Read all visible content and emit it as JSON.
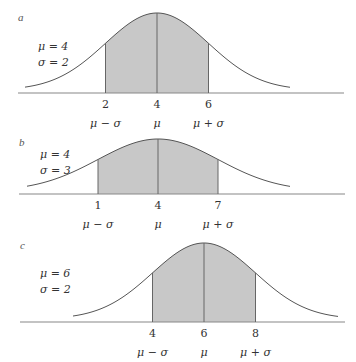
{
  "chart_data": [
    {
      "type": "area",
      "panel_label": "a",
      "params": {
        "mu": 4,
        "sigma": 2
      },
      "param_labels": [
        "μ = 4",
        "σ = 2"
      ],
      "shaded_region": [
        2,
        6
      ],
      "ticks": [
        {
          "value": 2,
          "label": "2",
          "symbol": "μ − σ"
        },
        {
          "value": 4,
          "label": "4",
          "symbol": "μ"
        },
        {
          "value": 6,
          "label": "6",
          "symbol": "μ + σ"
        }
      ],
      "colors": {
        "curve": "#555555",
        "fill": "#c8c8c8",
        "axis": "#888888"
      }
    },
    {
      "type": "area",
      "panel_label": "b",
      "params": {
        "mu": 4,
        "sigma": 3
      },
      "param_labels": [
        "μ = 4",
        "σ = 3"
      ],
      "shaded_region": [
        1,
        7
      ],
      "ticks": [
        {
          "value": 1,
          "label": "1",
          "symbol": "μ − σ"
        },
        {
          "value": 4,
          "label": "4",
          "symbol": "μ"
        },
        {
          "value": 7,
          "label": "7",
          "symbol": "μ + σ"
        }
      ],
      "colors": {
        "curve": "#555555",
        "fill": "#c8c8c8",
        "axis": "#888888"
      }
    },
    {
      "type": "area",
      "panel_label": "c",
      "params": {
        "mu": 6,
        "sigma": 2
      },
      "param_labels": [
        "μ = 6",
        "σ = 2"
      ],
      "shaded_region": [
        4,
        8
      ],
      "ticks": [
        {
          "value": 4,
          "label": "4",
          "symbol": "μ − σ"
        },
        {
          "value": 6,
          "label": "6",
          "symbol": "μ"
        },
        {
          "value": 8,
          "label": "8",
          "symbol": "μ + σ"
        }
      ],
      "colors": {
        "curve": "#555555",
        "fill": "#c8c8c8",
        "axis": "#888888"
      }
    }
  ]
}
